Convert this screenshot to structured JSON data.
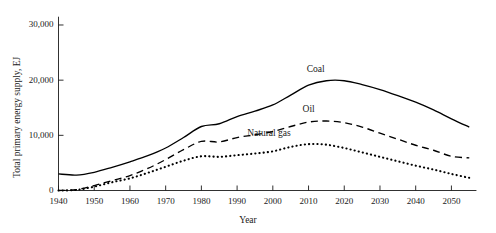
{
  "chart_data": {
    "type": "line",
    "title": "",
    "xlabel": "Year",
    "ylabel": "Total primary energy supply, EJ",
    "xlim": [
      1940,
      2057
    ],
    "ylim": [
      0,
      31500
    ],
    "grid": false,
    "legend": "inline-labels",
    "xticks": [
      1940,
      1950,
      1960,
      1970,
      1980,
      1990,
      2000,
      2010,
      2020,
      2030,
      2040,
      2050
    ],
    "xtick_labels": [
      "1940",
      "1950",
      "1960",
      "1970",
      "1980",
      "1990",
      "2000",
      "2010",
      "2020",
      "2030",
      "2040",
      "2050"
    ],
    "yticks": [
      0,
      10000,
      20000,
      30000
    ],
    "ytick_labels": [
      "0",
      "10,000",
      "20,000",
      "30,000"
    ],
    "x": [
      1940,
      1945,
      1950,
      1955,
      1960,
      1965,
      1970,
      1975,
      1980,
      1985,
      1990,
      1995,
      2000,
      2005,
      2010,
      2015,
      2020,
      2025,
      2030,
      2035,
      2040,
      2045,
      2050,
      2055
    ],
    "series": [
      {
        "name": "Coal",
        "style": "solid",
        "color": "#000000",
        "label_x": 2012,
        "label_y": 21800,
        "values": [
          3000,
          2800,
          3300,
          4200,
          5200,
          6300,
          7700,
          9600,
          11600,
          12100,
          13400,
          14400,
          15500,
          17300,
          19100,
          19900,
          19900,
          19200,
          18300,
          17200,
          16000,
          14600,
          13000,
          11500
        ]
      },
      {
        "name": "Oil",
        "style": "dashed",
        "color": "#000000",
        "label_x": 2010,
        "label_y": 14600,
        "values": [
          0,
          150,
          900,
          1800,
          2700,
          4000,
          5600,
          7400,
          8900,
          8800,
          9600,
          10100,
          10700,
          11600,
          12400,
          12600,
          12300,
          11500,
          10400,
          9300,
          8200,
          7300,
          6200,
          5900
        ]
      },
      {
        "name": "Natural gas",
        "style": "dotted",
        "color": "#000000",
        "label_x": 1999,
        "label_y": 10200,
        "values": [
          0,
          100,
          700,
          1500,
          2200,
          3200,
          4300,
          5400,
          6200,
          6100,
          6400,
          6700,
          7100,
          7900,
          8400,
          8300,
          7700,
          6900,
          6100,
          5300,
          4500,
          3800,
          3000,
          2300
        ]
      }
    ]
  }
}
